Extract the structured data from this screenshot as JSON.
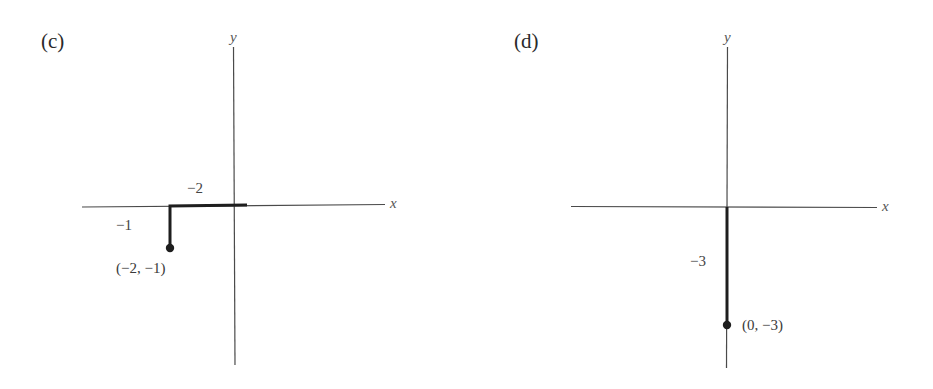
{
  "figure": {
    "panels": [
      {
        "id": "c",
        "label": "(c)",
        "axes": {
          "x_label": "x",
          "y_label": "y"
        },
        "path": {
          "description": "Move 2 units left along x-axis from origin, then 1 unit down",
          "segments": [
            {
              "from": [
                0,
                0
              ],
              "to": [
                -2,
                0
              ],
              "length_label": "−2"
            },
            {
              "from": [
                -2,
                0
              ],
              "to": [
                -2,
                -1
              ],
              "length_label": "−1"
            }
          ]
        },
        "endpoint": {
          "coords": [
            -2,
            -1
          ],
          "label": "(−2, −1)"
        }
      },
      {
        "id": "d",
        "label": "(d)",
        "axes": {
          "x_label": "x",
          "y_label": "y"
        },
        "path": {
          "description": "Move 3 units down along y-axis from origin",
          "segments": [
            {
              "from": [
                0,
                0
              ],
              "to": [
                0,
                -3
              ],
              "length_label": "−3"
            }
          ]
        },
        "endpoint": {
          "coords": [
            0,
            -3
          ],
          "label": "(0, −3)"
        }
      }
    ],
    "colors": {
      "axis": "#4a4a4a",
      "path": "#1e1e1e",
      "point": "#1e1e1e",
      "background": "#ffffff"
    }
  }
}
